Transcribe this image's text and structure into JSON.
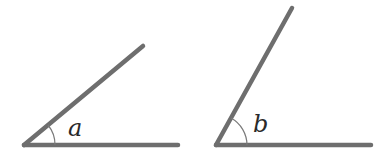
{
  "figure": {
    "angles": [
      {
        "label": "a",
        "vertex": [
          24,
          145
        ],
        "base_ray_end": [
          178,
          145
        ],
        "upper_ray_end": [
          143,
          46
        ]
      },
      {
        "label": "b",
        "vertex": [
          216,
          145
        ],
        "base_ray_end": [
          371,
          145
        ],
        "upper_ray_end": [
          292,
          8
        ]
      }
    ],
    "line_color": "#6e6e6e",
    "label_color": "#2a2a2a"
  }
}
